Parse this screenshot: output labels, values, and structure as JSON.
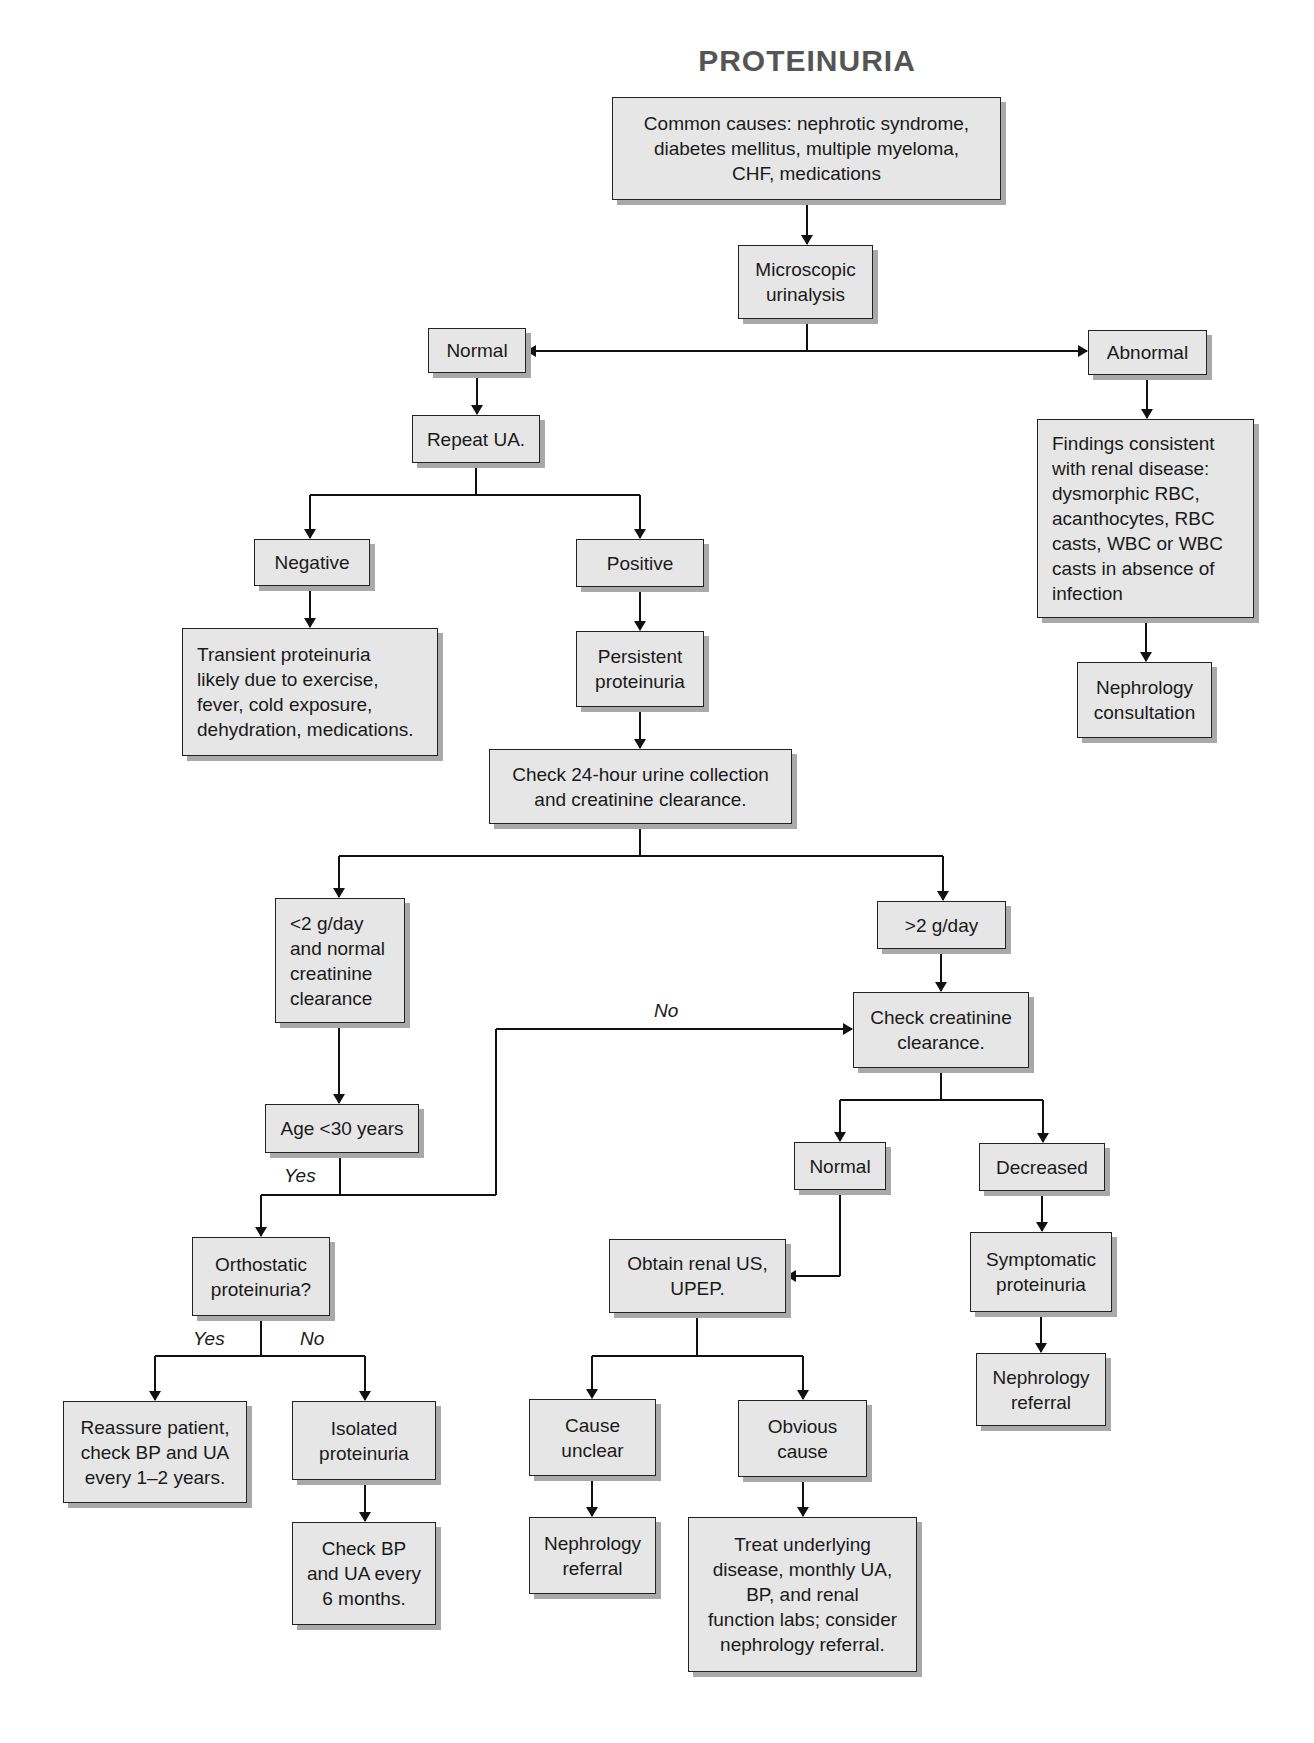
{
  "title": "PROTEINURIA",
  "nodes": {
    "common_causes": "Common causes: nephrotic syndrome,\ndiabetes mellitus, multiple myeloma,\nCHF, medications",
    "microscopic_ua": "Microscopic\nurinalysis",
    "normal_ua": "Normal",
    "abnormal_ua": "Abnormal",
    "repeat_ua": "Repeat UA.",
    "renal_findings": "Findings consistent\nwith renal disease:\ndysmorphic RBC,\nacanthocytes, RBC\ncasts, WBC or WBC\ncasts in absence of\ninfection",
    "negative": "Negative",
    "positive": "Positive",
    "transient": "Transient proteinuria\nlikely due to exercise,\nfever, cold exposure,\ndehydration, medications.",
    "persistent": "Persistent\nproteinuria",
    "nephrology_consultation": "Nephrology\nconsultation",
    "check_24h": "Check 24-hour urine collection\nand creatinine clearance.",
    "lt2": "<2 g/day\nand normal\ncreatinine\nclearance",
    "gt2": ">2 g/day",
    "check_creatinine": "Check creatinine\nclearance.",
    "age_lt30": "Age <30 years",
    "normal_cc": "Normal",
    "decreased_cc": "Decreased",
    "orthostatic": "Orthostatic\nproteinuria?",
    "obtain_renal_us": "Obtain renal US,\nUPEP.",
    "symptomatic": "Symptomatic\nproteinuria",
    "reassure": "Reassure patient,\ncheck BP and UA\nevery 1–2 years.",
    "isolated": "Isolated\nproteinuria",
    "cause_unclear": "Cause\nunclear",
    "obvious_cause": "Obvious\ncause",
    "nephrology_referral_right": "Nephrology\nreferral",
    "check_bp": "Check BP\nand UA every\n6 months.",
    "nephrology_referral_mid": "Nephrology\nreferral",
    "treat_underlying": "Treat underlying\ndisease, monthly UA,\nBP, and renal\nfunction labs; consider\nnephrology referral."
  },
  "edge_labels": {
    "age_no": "No",
    "age_yes": "Yes",
    "ortho_yes": "Yes",
    "ortho_no": "No"
  },
  "colors": {
    "box_fill": "#e6e6e6",
    "box_border": "#222222",
    "shadow": "#a9a9a9",
    "title": "#555555"
  }
}
